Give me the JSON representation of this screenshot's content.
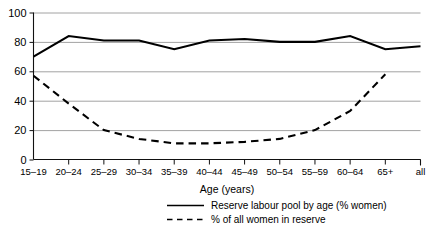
{
  "chart_data": {
    "type": "line",
    "title": "",
    "xlabel": "Age (years)",
    "ylabel": "",
    "ylim": [
      0,
      100
    ],
    "yticks": [
      0,
      20,
      40,
      60,
      80,
      100
    ],
    "grid": true,
    "legend_position": "bottom",
    "categories": [
      "15–19",
      "20–24",
      "25–29",
      "30–34",
      "35–39",
      "40–44",
      "45–49",
      "50–54",
      "55–59",
      "60–64",
      "65+",
      "all"
    ],
    "series": [
      {
        "name": "Reserve labour pool by age (% women)",
        "style": "solid",
        "values": [
          70,
          84,
          81,
          81,
          75,
          81,
          82,
          80,
          80,
          84,
          75,
          77
        ]
      },
      {
        "name": "% of all women in reserve",
        "style": "dashed",
        "values": [
          57,
          38,
          20,
          14,
          11,
          11,
          12,
          14,
          20,
          33,
          58,
          null
        ]
      }
    ]
  },
  "axes": {
    "y_tick_labels": [
      "0",
      "20",
      "40",
      "60",
      "80",
      "100"
    ],
    "x_tick_labels": [
      "15–19",
      "20–24",
      "25–29",
      "30–34",
      "35–39",
      "40–44",
      "45–49",
      "50–54",
      "55–59",
      "60–64",
      "65+",
      "all"
    ],
    "x_axis_title": "Age (years)"
  },
  "legend": {
    "entries": [
      {
        "label": "Reserve labour pool by age (% women)",
        "style": "solid"
      },
      {
        "label": "% of all women in reserve",
        "style": "dashed"
      }
    ]
  },
  "colors": {
    "series_line": "#000000",
    "gridline": "#8a8a8a",
    "axis": "#111111",
    "background": "#ffffff"
  }
}
